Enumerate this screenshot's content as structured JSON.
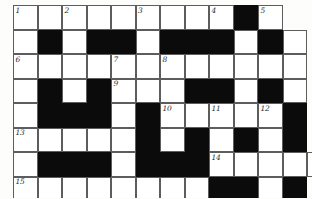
{
  "puzzle": {
    "kind": "crossword-grid",
    "title": "Crossword Puzzle Grid",
    "columns": 12,
    "rows": 8,
    "cell_size": 24.5,
    "origin_x": 13,
    "origin_y": 5,
    "colors": {
      "block": "#0b0b0b",
      "cell": "#ffffff",
      "grid_line": "#5d5d5d",
      "number": "#2b2b2b",
      "paper": "#fdfdfb"
    },
    "legend": {
      "open_label": "open cell",
      "block_label": "blocked cell"
    },
    "clue_numbers": [
      1,
      2,
      3,
      4,
      5,
      6,
      7,
      8,
      9,
      10,
      11,
      12,
      13,
      14,
      15
    ],
    "grid": [
      [
        "open",
        "open",
        "open",
        "open",
        "open",
        "open",
        "open",
        "open",
        "open",
        "block",
        "open",
        "none"
      ],
      [
        "open",
        "block",
        "open",
        "block",
        "block",
        "open",
        "block",
        "block",
        "block",
        "open",
        "block",
        "open"
      ],
      [
        "open",
        "open",
        "open",
        "open",
        "open",
        "open",
        "open",
        "open",
        "open",
        "open",
        "open",
        "open"
      ],
      [
        "open",
        "block",
        "open",
        "block",
        "open",
        "open",
        "open",
        "block",
        "block",
        "open",
        "block",
        "open"
      ],
      [
        "open",
        "block",
        "block",
        "block",
        "open",
        "block",
        "open",
        "open",
        "open",
        "open",
        "open",
        "block"
      ],
      [
        "open",
        "open",
        "open",
        "open",
        "open",
        "block",
        "open",
        "block",
        "open",
        "block",
        "open",
        "block"
      ],
      [
        "open",
        "block",
        "block",
        "block",
        "open",
        "block",
        "block",
        "block",
        "open",
        "open",
        "open",
        "open"
      ],
      [
        "open",
        "open",
        "open",
        "open",
        "open",
        "open",
        "open",
        "open",
        "block",
        "block",
        "open",
        "block"
      ]
    ],
    "numbered_cells": [
      {
        "n": "1",
        "row": 0,
        "col": 0
      },
      {
        "n": "2",
        "row": 0,
        "col": 2
      },
      {
        "n": "3",
        "row": 0,
        "col": 5
      },
      {
        "n": "4",
        "row": 0,
        "col": 8
      },
      {
        "n": "5",
        "row": 0,
        "col": 10
      },
      {
        "n": "6",
        "row": 2,
        "col": 0
      },
      {
        "n": "7",
        "row": 2,
        "col": 4
      },
      {
        "n": "8",
        "row": 2,
        "col": 6
      },
      {
        "n": "9",
        "row": 3,
        "col": 4
      },
      {
        "n": "10",
        "row": 4,
        "col": 6
      },
      {
        "n": "11",
        "row": 4,
        "col": 8
      },
      {
        "n": "12",
        "row": 4,
        "col": 10
      },
      {
        "n": "13",
        "row": 5,
        "col": 0
      },
      {
        "n": "14",
        "row": 6,
        "col": 8
      },
      {
        "n": "15",
        "row": 7,
        "col": 0
      }
    ],
    "extra_cells": [
      {
        "row": 6,
        "col": 12,
        "state": "open"
      }
    ]
  }
}
